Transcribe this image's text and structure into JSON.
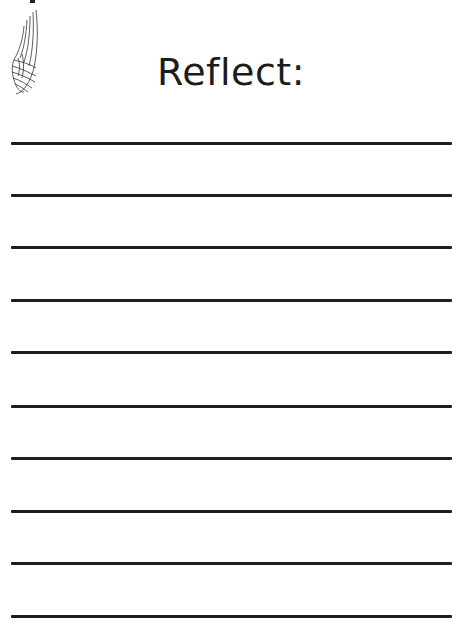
{
  "page": {
    "title": "Reflect:",
    "decoration": "wing-icon",
    "line_color": "#1e1e1e",
    "lines": [
      {
        "y": 142
      },
      {
        "y": 194
      },
      {
        "y": 246
      },
      {
        "y": 299
      },
      {
        "y": 351
      },
      {
        "y": 405
      },
      {
        "y": 457
      },
      {
        "y": 510
      },
      {
        "y": 562
      },
      {
        "y": 615
      }
    ]
  }
}
